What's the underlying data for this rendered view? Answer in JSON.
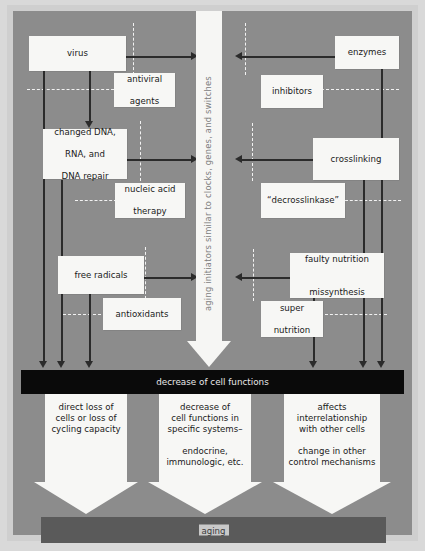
{
  "diagram": {
    "colors": {
      "canvas": "#8c8c8c",
      "mat": "#cfcfcf",
      "box_fill": "#f7f7f5",
      "solid_line": "#2b2b2b",
      "dashed_line": "#f2f2f2",
      "black_band": "#0a0a0a",
      "aging_band": "#5a5a5a",
      "vertical_text": "#7d7d7d"
    },
    "center_arrow": {
      "label": "aging initiators similar to clocks, genes, and switches",
      "direction": "down"
    },
    "left_column": {
      "causes": [
        {
          "id": "virus",
          "label": "virus"
        },
        {
          "id": "changed-dna",
          "label": "changed DNA,\nRNA, and\nDNA repair",
          "lines": [
            "changed DNA,",
            "RNA, and",
            "DNA repair"
          ]
        },
        {
          "id": "free-radicals",
          "label": "free radicals"
        }
      ],
      "interventions": [
        {
          "id": "antiviral-agents",
          "label": "antiviral\nagents",
          "lines": [
            "antiviral",
            "agents"
          ]
        },
        {
          "id": "nucleic-acid-therapy",
          "label": "nucleic acid\ntherapy",
          "lines": [
            "nucleic acid",
            "therapy"
          ]
        },
        {
          "id": "antioxidants",
          "label": "antioxidants",
          "lines": [
            "antioxidants"
          ]
        }
      ]
    },
    "right_column": {
      "causes": [
        {
          "id": "enzymes",
          "label": "enzymes"
        },
        {
          "id": "crosslinking",
          "label": "crosslinking"
        },
        {
          "id": "faulty-nutrition",
          "label": "faulty nutrition\n\nmissynthesis",
          "lines": [
            "faulty nutrition",
            "missynthesis"
          ]
        }
      ],
      "interventions": [
        {
          "id": "inhibitors",
          "label": "inhibitors",
          "lines": [
            "inhibitors"
          ]
        },
        {
          "id": "decrosslinkase",
          "label": "“decrosslinkase”",
          "lines": [
            "“decrosslinkase”"
          ]
        },
        {
          "id": "super-nutrition",
          "label": "super\nnutrition",
          "lines": [
            "super",
            "nutrition"
          ]
        }
      ]
    },
    "black_band": {
      "label": "decrease of cell functions"
    },
    "outcomes": [
      {
        "id": "direct-loss",
        "lines": [
          "direct loss of",
          "cells or loss of",
          "cycling capacity"
        ],
        "lines2": []
      },
      {
        "id": "decrease-specific-systems",
        "lines": [
          "decrease of",
          "cell functions in",
          "specific systems–"
        ],
        "lines2": [
          "endocrine,",
          "immunologic, etc."
        ]
      },
      {
        "id": "affects-interrelationship",
        "lines": [
          "affects",
          "interrelationship",
          "with other cells"
        ],
        "lines2": [
          "change in other",
          "control mechanisms"
        ]
      }
    ],
    "aging_band": {
      "label": "aging"
    }
  }
}
